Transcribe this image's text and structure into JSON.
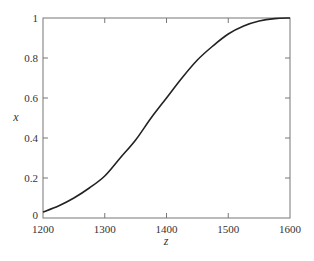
{
  "chart_data": {
    "type": "line",
    "title": "",
    "xlabel": "z",
    "ylabel": "x",
    "xlim": [
      1200,
      1600
    ],
    "ylim": [
      0,
      1
    ],
    "grid": false,
    "legend": null,
    "x_ticks": [
      1200,
      1300,
      1400,
      1500,
      1600
    ],
    "x_tick_labels": [
      "1200",
      "1300",
      "1400",
      "1500",
      "1600"
    ],
    "y_ticks": [
      0,
      0.2,
      0.4,
      0.6,
      0.8,
      1
    ],
    "y_tick_labels": [
      "0",
      "0.2",
      "0.4",
      "0.6",
      "0.8",
      "1"
    ],
    "series": [
      {
        "name": "x(z)",
        "color": "#222222",
        "x": [
          1200,
          1225,
          1250,
          1275,
          1300,
          1325,
          1350,
          1375,
          1400,
          1425,
          1450,
          1475,
          1500,
          1525,
          1550,
          1575,
          1600
        ],
        "y": [
          0.03,
          0.06,
          0.1,
          0.15,
          0.21,
          0.3,
          0.39,
          0.5,
          0.6,
          0.7,
          0.79,
          0.86,
          0.92,
          0.96,
          0.985,
          0.997,
          1.0
        ]
      }
    ]
  },
  "colors": {
    "axis": "#777777",
    "curve": "#222222",
    "text": "#333333",
    "background": "#ffffff"
  }
}
